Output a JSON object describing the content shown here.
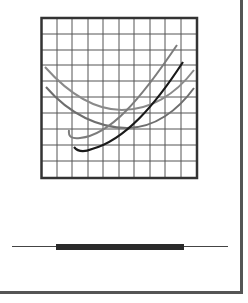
{
  "graphic": {
    "kind": "chart-icon-illustration",
    "grid": {
      "columns": 10,
      "rows": 10,
      "border_color": "#333333",
      "grid_color": "#555555"
    },
    "curves": [
      {
        "name": "upper-u-curve",
        "color": "#8a8a8a",
        "shape": "u"
      },
      {
        "name": "lower-u-curve",
        "color": "#6e6e6e",
        "shape": "u"
      },
      {
        "name": "rising-gray-curve",
        "color": "#7c7c7c",
        "shape": "rising"
      },
      {
        "name": "rising-black-curve",
        "color": "#1a1a1a",
        "shape": "rising"
      }
    ],
    "bar": {
      "color": "#2a2a2a",
      "line_color": "#444444"
    },
    "panel_border_color": "#555555"
  }
}
